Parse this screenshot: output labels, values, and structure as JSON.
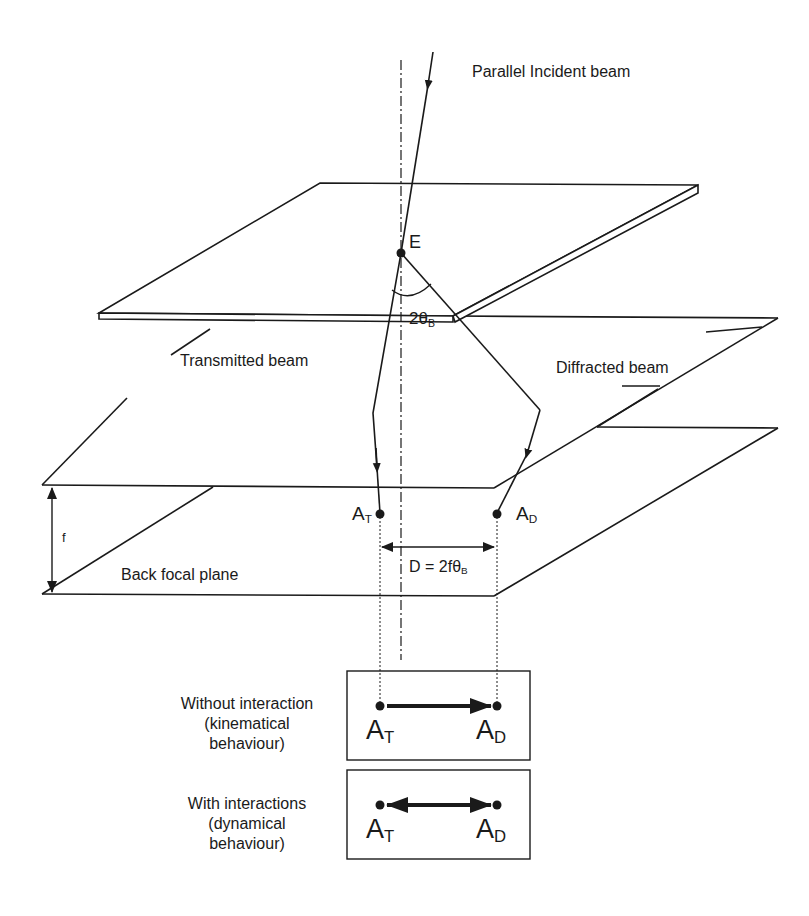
{
  "figure": {
    "labels": {
      "incident_beam": "Parallel Incident beam",
      "point_e": "E",
      "angle": "2θ",
      "angle_sub": "B",
      "transmitted_beam": "Transmitted beam",
      "diffracted_beam": "Diffracted beam",
      "focal_length": "f",
      "back_focal_plane": "Back focal plane",
      "spot_t_main": "A",
      "spot_t_sub": "T",
      "spot_d_main": "A",
      "spot_d_sub": "D",
      "distance_eq": "D = 2fθ",
      "distance_eq_sub": "B"
    },
    "cases": [
      {
        "title_line1": "Without interaction",
        "title_line2": "(kinematical",
        "title_line3": "behaviour)",
        "arrow": "single",
        "left_main": "A",
        "left_sub": "T",
        "right_main": "A",
        "right_sub": "D"
      },
      {
        "title_line1": "With interactions",
        "title_line2": "(dynamical",
        "title_line3": "behaviour)",
        "arrow": "double",
        "left_main": "A",
        "left_sub": "T",
        "right_main": "A",
        "right_sub": "D"
      }
    ],
    "colors": {
      "line": "#1a1a1a",
      "background": "#ffffff"
    }
  }
}
